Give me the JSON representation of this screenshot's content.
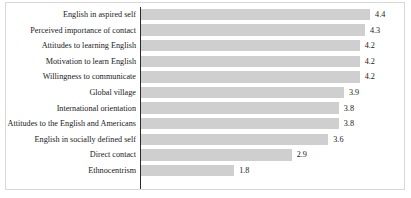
{
  "chart_data": {
    "type": "bar",
    "orientation": "horizontal",
    "title": "",
    "subtitle": "",
    "xlabel": "",
    "ylabel": "",
    "xlim": [
      0,
      5
    ],
    "grid": false,
    "legend": null,
    "bar_color": "#cfcfcf",
    "axis_color": "#2b2b2b",
    "border_color": "#d8d8d8",
    "text_color": "#1a1a1a",
    "value_label_format": "one-decimal",
    "categories": [
      "English in aspired self",
      "Perceived importance of  contact",
      "Attitudes to learning English",
      "Motivation to learn English",
      "Willingness to communicate",
      "Global village",
      "International orientation",
      "Attitudes to the English and Americans",
      "English in socially defined self",
      "Direct contact",
      "Ethnocentrism"
    ],
    "values": [
      4.4,
      4.3,
      4.2,
      4.2,
      4.2,
      3.9,
      3.8,
      3.8,
      3.6,
      2.9,
      1.8
    ],
    "value_labels": [
      "4.4",
      "4.3",
      "4.2",
      "4.2",
      "4.2",
      "3.9",
      "3.8",
      "3.8",
      "3.6",
      "2.9",
      "1.8"
    ]
  },
  "rows": [
    {
      "label": "English in aspired self",
      "value": 4.4,
      "value_label": "4.4"
    },
    {
      "label": "Perceived importance of  contact",
      "value": 4.3,
      "value_label": "4.3"
    },
    {
      "label": "Attitudes to learning English",
      "value": 4.2,
      "value_label": "4.2"
    },
    {
      "label": "Motivation to learn English",
      "value": 4.2,
      "value_label": "4.2"
    },
    {
      "label": "Willingness to communicate",
      "value": 4.2,
      "value_label": "4.2"
    },
    {
      "label": "Global village",
      "value": 3.9,
      "value_label": "3.9"
    },
    {
      "label": "International orientation",
      "value": 3.8,
      "value_label": "3.8"
    },
    {
      "label": "Attitudes to the English and Americans",
      "value": 3.8,
      "value_label": "3.8"
    },
    {
      "label": "English in socially defined self",
      "value": 3.6,
      "value_label": "3.6"
    },
    {
      "label": "Direct contact",
      "value": 2.9,
      "value_label": "2.9"
    },
    {
      "label": "Ethnocentrism",
      "value": 1.8,
      "value_label": "1.8"
    }
  ]
}
